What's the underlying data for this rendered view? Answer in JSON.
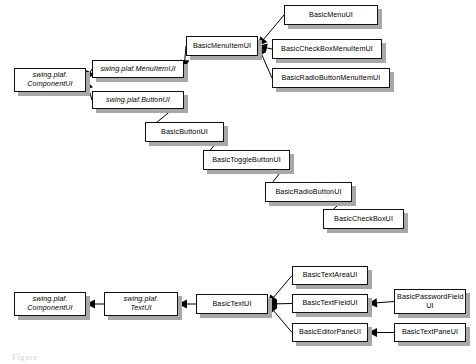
{
  "diagram": {
    "colors": {
      "box_fill": "#ffffff",
      "box_border": "#111111",
      "shadow": "#a8a8a8",
      "link": "#000000"
    },
    "clipped_footer_text": "Figure",
    "nodes": [
      {
        "id": "componentui_top",
        "label": "swing.plaf.\nComponentUI",
        "abstract": true,
        "x": 14,
        "y": 68,
        "w": 72,
        "h": 24
      },
      {
        "id": "menuitemui",
        "label": "swing.plaf.MenuItemUI",
        "abstract": true,
        "x": 92,
        "y": 60,
        "w": 92,
        "h": 18
      },
      {
        "id": "buttonui",
        "label": "swing.plaf.ButtonUI",
        "abstract": true,
        "x": 92,
        "y": 91,
        "w": 92,
        "h": 18
      },
      {
        "id": "basicmenuitemui",
        "label": "BasicMenuItemUI",
        "abstract": false,
        "x": 186,
        "y": 36,
        "w": 72,
        "h": 20
      },
      {
        "id": "basicmenuui",
        "label": "BasicMenuUI",
        "abstract": false,
        "x": 284,
        "y": 5,
        "w": 94,
        "h": 20
      },
      {
        "id": "basiccheckboxmenuitemui",
        "label": "BasicCheckBoxMenuItemUI",
        "abstract": false,
        "x": 272,
        "y": 39,
        "w": 110,
        "h": 20
      },
      {
        "id": "basicradiobuttonmenuitemui",
        "label": "BasicRadioButtonMenuItemUI",
        "abstract": false,
        "x": 272,
        "y": 68,
        "w": 118,
        "h": 20
      },
      {
        "id": "basicbuttonui",
        "label": "BasicButtonUI",
        "abstract": false,
        "x": 145,
        "y": 122,
        "w": 79,
        "h": 20
      },
      {
        "id": "basictogglebuttonui",
        "label": "BasicToggleButtonUI",
        "abstract": false,
        "x": 203,
        "y": 150,
        "w": 87,
        "h": 20
      },
      {
        "id": "basicradiobuttonui",
        "label": "BasicRadioButtonUI",
        "abstract": false,
        "x": 265,
        "y": 182,
        "w": 87,
        "h": 20
      },
      {
        "id": "basiccheckboxui",
        "label": "BasicCheckBoxUI",
        "abstract": false,
        "x": 323,
        "y": 209,
        "w": 81,
        "h": 20
      },
      {
        "id": "componentui_bottom",
        "label": "swing.plaf.\nComponentUI",
        "abstract": true,
        "x": 14,
        "y": 292,
        "w": 72,
        "h": 24
      },
      {
        "id": "textui",
        "label": "swing.plaf.\nTextUI",
        "abstract": true,
        "x": 104,
        "y": 292,
        "w": 74,
        "h": 24
      },
      {
        "id": "basictextui",
        "label": "BasicTextUI",
        "abstract": false,
        "x": 196,
        "y": 294,
        "w": 72,
        "h": 20
      },
      {
        "id": "basictextareaui",
        "label": "BasicTextAreaUI",
        "abstract": false,
        "x": 292,
        "y": 266,
        "w": 76,
        "h": 19
      },
      {
        "id": "basictextfieldui",
        "label": "BasicTextFieldUI",
        "abstract": false,
        "x": 292,
        "y": 294,
        "w": 76,
        "h": 19
      },
      {
        "id": "basiceditorpaneui",
        "label": "BasicEditorPaneUI",
        "abstract": false,
        "x": 292,
        "y": 323,
        "w": 76,
        "h": 19
      },
      {
        "id": "basicpasswordfieldui",
        "label": "BasicPasswordField\nUI",
        "abstract": false,
        "x": 394,
        "y": 289,
        "w": 72,
        "h": 25
      },
      {
        "id": "basictextpaneui",
        "label": "BasicTextPaneUI",
        "abstract": false,
        "x": 394,
        "y": 323,
        "w": 72,
        "h": 19
      }
    ],
    "edges": [
      {
        "from": "menuitemui",
        "to": "componentui_top"
      },
      {
        "from": "buttonui",
        "to": "componentui_top"
      },
      {
        "from": "basicmenuitemui",
        "to": "menuitemui"
      },
      {
        "from": "basicmenuui",
        "to": "basicmenuitemui"
      },
      {
        "from": "basiccheckboxmenuitemui",
        "to": "basicmenuitemui"
      },
      {
        "from": "basicradiobuttonmenuitemui",
        "to": "basicmenuitemui"
      },
      {
        "from": "basicbuttonui",
        "to": "buttonui"
      },
      {
        "from": "basictogglebuttonui",
        "to": "basicbuttonui"
      },
      {
        "from": "basicradiobuttonui",
        "to": "basictogglebuttonui"
      },
      {
        "from": "basiccheckboxui",
        "to": "basicradiobuttonui"
      },
      {
        "from": "textui",
        "to": "componentui_bottom"
      },
      {
        "from": "basictextui",
        "to": "textui"
      },
      {
        "from": "basictextareaui",
        "to": "basictextui"
      },
      {
        "from": "basictextfieldui",
        "to": "basictextui"
      },
      {
        "from": "basiceditorpaneui",
        "to": "basictextui"
      },
      {
        "from": "basicpasswordfieldui",
        "to": "basictextfieldui"
      },
      {
        "from": "basictextpaneui",
        "to": "basiceditorpaneui"
      }
    ]
  }
}
